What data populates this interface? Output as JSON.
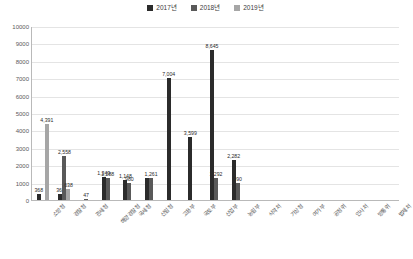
{
  "chart_data": {
    "type": "bar",
    "title": "",
    "subtitle": "",
    "xlabel": "",
    "ylabel": "",
    "ylim": [
      0,
      10000
    ],
    "ytick_step": 1000,
    "yticks": [
      "0",
      "1000",
      "2000",
      "3000",
      "4000",
      "5000",
      "6000",
      "7000",
      "8000",
      "9000",
      "10000"
    ],
    "grid": true,
    "legend_position": "top-center",
    "categories": [
      "소방청",
      "경찰청",
      "관세청",
      "해양경찰청",
      "국세청",
      "산림청",
      "고용부",
      "국토부",
      "산업부",
      "농림부",
      "식약처",
      "기상청",
      "여가부",
      "공정위",
      "인사처",
      "방통위",
      "법제처"
    ],
    "series": [
      {
        "name": "2017년",
        "color": "#2b2b2b",
        "values": [
          368,
          366,
          0,
          1343,
          1148,
          1268,
          7004,
          3599,
          8645,
          2282,
          0,
          0,
          0,
          0,
          0,
          0,
          0
        ]
      },
      {
        "name": "2018년",
        "color": "#595959",
        "values": [
          0,
          2558,
          47,
          1288,
          980,
          1261,
          0,
          0,
          1292,
          990,
          0,
          0,
          0,
          0,
          0,
          0,
          0
        ]
      },
      {
        "name": "2019년",
        "color": "#a6a6a6",
        "values": [
          4391,
          638,
          0,
          0,
          0,
          0,
          0,
          0,
          0,
          0,
          0,
          0,
          0,
          0,
          0,
          0,
          0
        ]
      }
    ],
    "data_labels": [
      {
        "text": "4,391",
        "value": 4391,
        "category": "소방청",
        "series": "2019년"
      },
      {
        "text": "368",
        "value": 368,
        "category": "소방청",
        "series": "2017년"
      },
      {
        "text": "2,558",
        "value": 2558,
        "category": "경찰청",
        "series": "2018년"
      },
      {
        "text": "638",
        "value": 638,
        "category": "경찰청",
        "series": "2019년"
      },
      {
        "text": "366",
        "value": 366,
        "category": "경찰청",
        "series": "2017년"
      },
      {
        "text": "47",
        "value": 47,
        "category": "관세청",
        "series": "2018년"
      },
      {
        "text": "1,343",
        "value": 1343,
        "category": "해양경찰청",
        "series": "2017년"
      },
      {
        "text": "1,288",
        "value": 1288,
        "category": "해양경찰청",
        "series": "2018년"
      },
      {
        "text": "7,004",
        "value": 7004,
        "category": "고용부",
        "series": "2017년"
      },
      {
        "text": "1,148",
        "value": 1148,
        "category": "국세청",
        "series": "2017년"
      },
      {
        "text": "980",
        "value": 980,
        "category": "국세청",
        "series": "2018년"
      },
      {
        "text": "3,599",
        "value": 3599,
        "category": "국토부",
        "series": "2017년"
      },
      {
        "text": "1,261",
        "value": 1261,
        "category": "산림청",
        "series": "2018년"
      },
      {
        "text": "8,645",
        "value": 8645,
        "category": "산업부",
        "series": "2017년"
      },
      {
        "text": "1,292",
        "value": 1292,
        "category": "산업부",
        "series": "2018년"
      },
      {
        "text": "2,282",
        "value": 2282,
        "category": "농림부",
        "series": "2017년"
      },
      {
        "text": "990",
        "value": 990,
        "category": "농림부",
        "series": "2018년"
      }
    ]
  },
  "legend": {
    "items": [
      {
        "label": "2017년",
        "color": "#2b2b2b"
      },
      {
        "label": "2018년",
        "color": "#595959"
      },
      {
        "label": "2019년",
        "color": "#a6a6a6"
      }
    ]
  }
}
